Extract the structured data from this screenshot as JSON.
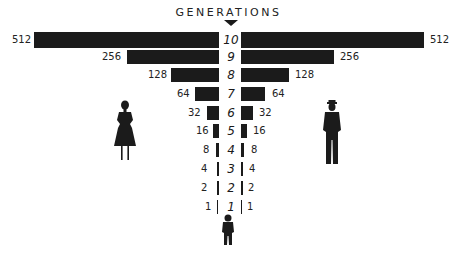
{
  "header": {
    "title": "GENERATIONS"
  },
  "colors": {
    "bar": "#1b1b1b",
    "background": "#ffffff"
  },
  "rows": [
    {
      "gen": "10",
      "left": "512",
      "right": "512"
    },
    {
      "gen": "9",
      "left": "256",
      "right": "256"
    },
    {
      "gen": "8",
      "left": "128",
      "right": "128"
    },
    {
      "gen": "7",
      "left": "64",
      "right": "64"
    },
    {
      "gen": "6",
      "left": "32",
      "right": "32"
    },
    {
      "gen": "5",
      "left": "16",
      "right": "16"
    },
    {
      "gen": "4",
      "left": "8",
      "right": "8"
    },
    {
      "gen": "3",
      "left": "4",
      "right": "4"
    },
    {
      "gen": "2",
      "left": "2",
      "right": "2"
    },
    {
      "gen": "1",
      "left": "1",
      "right": "1"
    }
  ],
  "figures": {
    "left": "woman-silhouette",
    "right": "man-silhouette",
    "bottom": "child-silhouette"
  }
}
